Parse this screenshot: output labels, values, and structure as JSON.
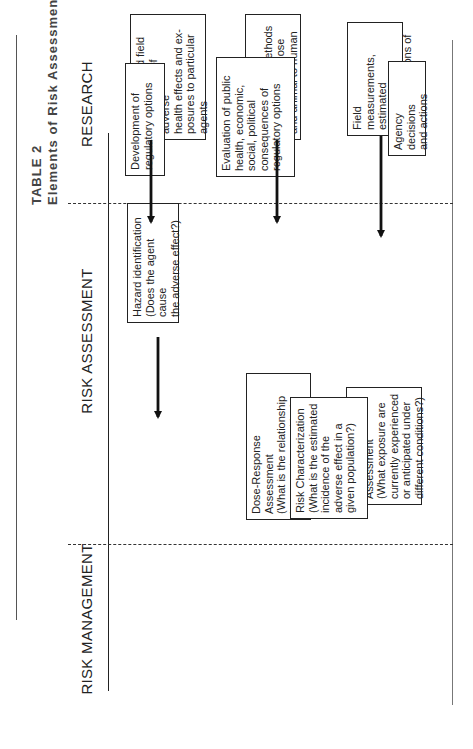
{
  "table": {
    "label": "TABLE 2",
    "title": "Elements of Risk Assessment and Risk Management"
  },
  "columns": {
    "research": "RESEARCH",
    "risk_assessment": "RISK ASSESSMENT",
    "risk_management": "RISK MANAGEMENT"
  },
  "research_boxes": [
    {
      "text": "Laboratory and field\nobservations of adverse\nhealth effects and ex-\nposures to particular\nagents"
    },
    {
      "text": "Information on\nextrapolation methods\nfor high to low dose\nand animal to human"
    },
    {
      "text": "Field measurements,\nestimated exposures,\ncharacterizations of\npopulations"
    }
  ],
  "assessment_boxes": [
    {
      "text": "Hazard identification\n(Does the agent cause\nthe adverse effect?)"
    },
    {
      "text": "Dose-Response Assessment\n(What is the relationship\nbetween dose and inci-\ndence in humans?)"
    },
    {
      "text": "Exposure Assessment\n(What exposure are\ncurrently experienced\nor anticipated under\ndifferent conditions?)"
    }
  ],
  "risk_characterization": {
    "text": "Risk Characterization\n(What is the estimated\nincidence of the\nadverse effect in a\ngiven population?)"
  },
  "management_boxes": [
    {
      "text": "Development of\nregulatory options"
    },
    {
      "text": "Evaluation of public\nhealth, economic,\nsocial, political\nconsequences of\nregulatory options"
    },
    {
      "text": "Agency decisions\nand actions"
    }
  ],
  "colors": {
    "line": "#222222",
    "text": "#222222",
    "background": "#ffffff"
  }
}
